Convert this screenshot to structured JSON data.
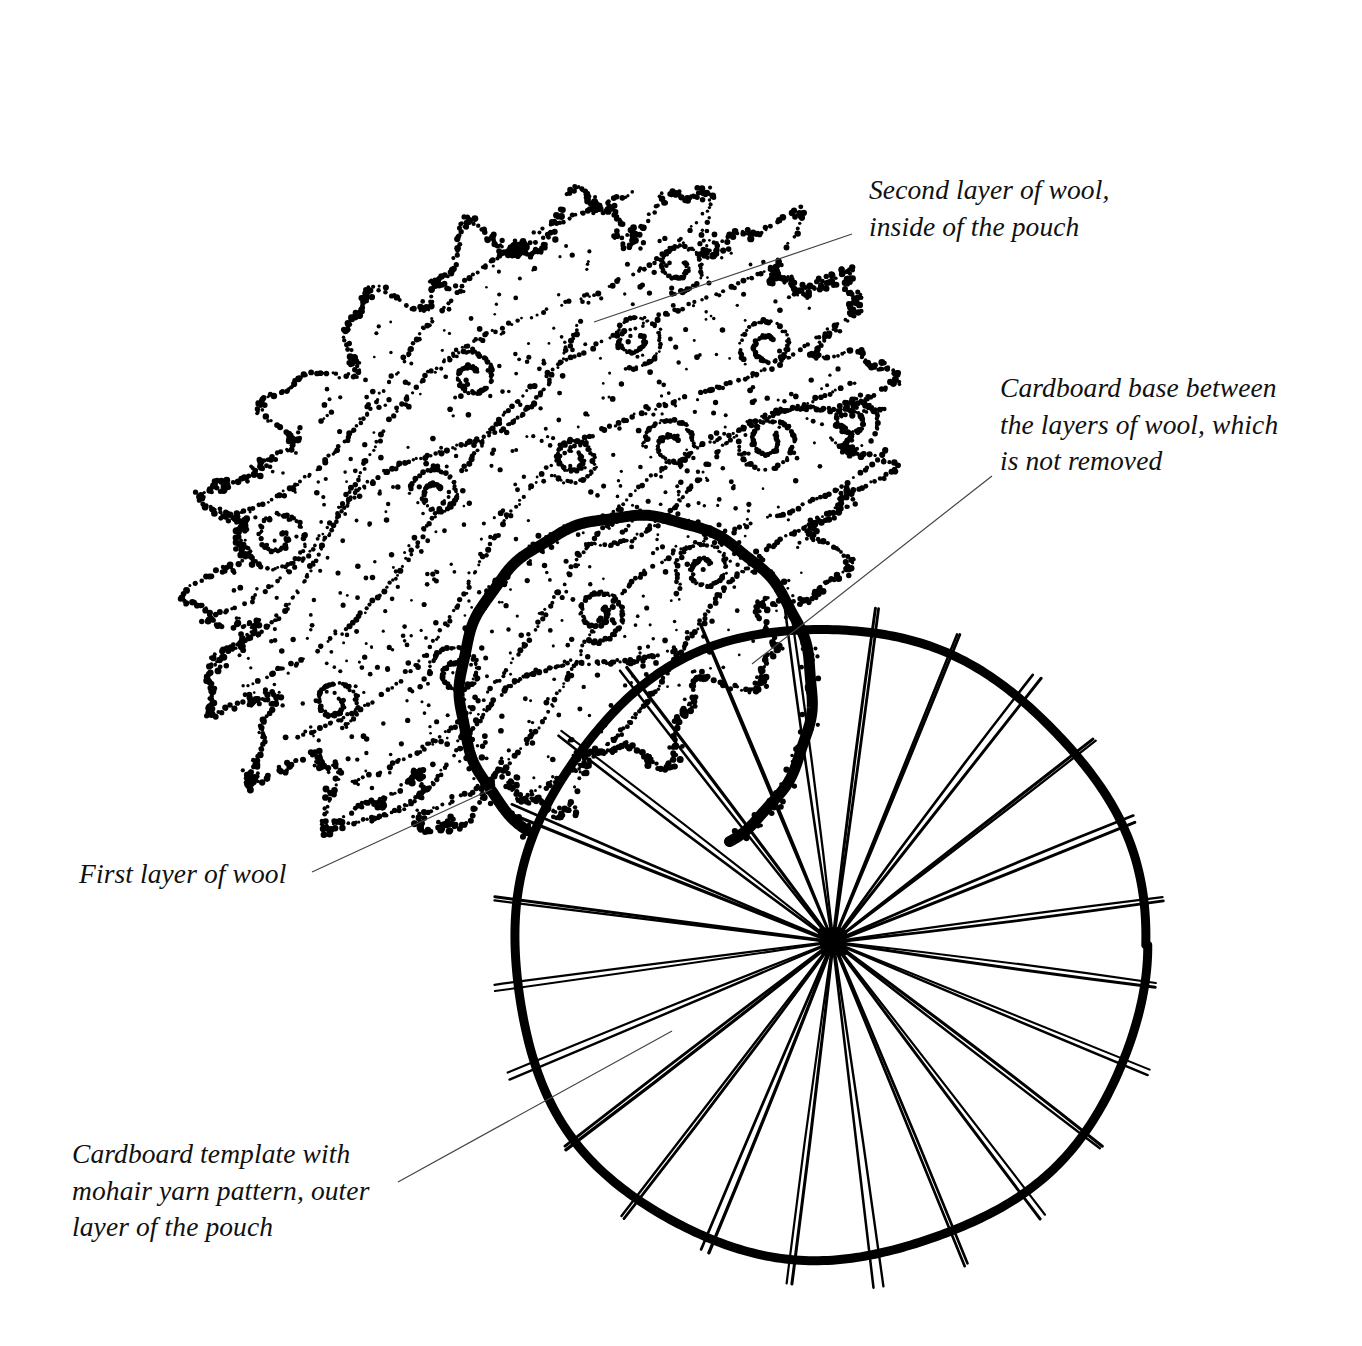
{
  "figure": {
    "background_color": "#ffffff",
    "ink_color": "#000000",
    "width": 1362,
    "height": 1346
  },
  "labels": [
    {
      "id": "second-layer",
      "text": "Second layer of wool,\ninside of the pouch",
      "lines": [
        "Second layer of wool,",
        "inside of the pouch"
      ],
      "leader_line": {
        "from_x": 594,
        "from_y": 322,
        "to_x": 852,
        "to_y": 234
      }
    },
    {
      "id": "cardboard-base",
      "text": "Cardboard base between\nthe layers of wool, which\nis not removed",
      "lines": [
        "Cardboard base between",
        "the layers of wool, which",
        "is not removed"
      ],
      "leader_line": {
        "from_x": 752,
        "from_y": 664,
        "to_x": 992,
        "to_y": 476
      }
    },
    {
      "id": "first-layer",
      "text": "First layer of wool",
      "lines": [
        "First layer of wool"
      ],
      "leader_line": {
        "from_x": 312,
        "from_y": 872,
        "to_x": 492,
        "to_y": 789
      }
    },
    {
      "id": "cardboard-template",
      "text": "Cardboard template with\nmohair yarn pattern, outer\nlayer of the pouch",
      "lines": [
        "Cardboard template with",
        "mohair yarn pattern, outer",
        "layer of the pouch"
      ],
      "leader_line": {
        "from_x": 398,
        "from_y": 1182,
        "to_x": 672,
        "to_y": 1031
      }
    }
  ],
  "drawing": {
    "wool_mass": {
      "name": "stippled wool cloud",
      "center_x": 540,
      "center_y": 510,
      "rotation_deg": -38,
      "radius_x": 360,
      "radius_y": 255,
      "lobe_count": 19,
      "rendering": "dotted stipple outline with scattered interior dots and spiral curls"
    },
    "cardboard_base_circle": {
      "name": "cardboard base inside wool",
      "center_x": 636,
      "center_y": 692,
      "radius": 176,
      "arc_start_deg": 128,
      "arc_end_deg": 418,
      "stroke": "heavy brush arc"
    },
    "cardboard_template": {
      "name": "cardboard template disc with mohair yarn",
      "center_x": 828,
      "center_y": 945,
      "radius": 316,
      "hub_x": 833,
      "hub_y": 942,
      "spoke_count": 24,
      "rim_stroke_width": 9,
      "spoke_stroke_width": 2.4,
      "spoke_overshoot": 26
    }
  }
}
